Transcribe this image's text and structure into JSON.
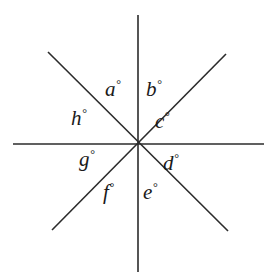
{
  "figure": {
    "background_color": "#ffffff",
    "line_color": "#2b2b2b",
    "text_color": "#1a1a1a",
    "line_width": 1.6,
    "vertex": {
      "x": 138,
      "y": 144
    },
    "lines": [
      {
        "name": "vertical-line",
        "x1": 138,
        "y1": 15,
        "x2": 138,
        "y2": 272
      },
      {
        "name": "horizontal-line",
        "x1": 13,
        "y1": 144,
        "x2": 264,
        "y2": 144
      },
      {
        "name": "diagonal-nw-se-line",
        "x1": 48,
        "y1": 52,
        "x2": 228,
        "y2": 231
      },
      {
        "name": "diagonal-ne-sw-line",
        "x1": 226,
        "y1": 54,
        "x2": 52,
        "y2": 230
      }
    ],
    "labels": [
      {
        "key": "a",
        "text": "a",
        "degree": "°"
      },
      {
        "key": "b",
        "text": "b",
        "degree": "°"
      },
      {
        "key": "c",
        "text": "c",
        "degree": "°"
      },
      {
        "key": "d",
        "text": "d",
        "degree": "°"
      },
      {
        "key": "e",
        "text": "e",
        "degree": "°"
      },
      {
        "key": "f",
        "text": "f",
        "degree": "°"
      },
      {
        "key": "g",
        "text": "g",
        "degree": "°"
      },
      {
        "key": "h",
        "text": "h",
        "degree": "°"
      }
    ]
  }
}
